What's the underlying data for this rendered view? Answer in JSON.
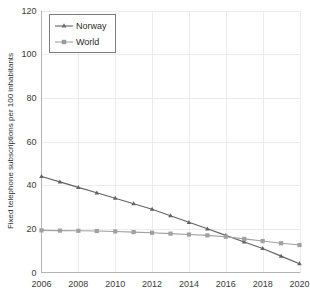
{
  "chart_data": {
    "type": "line",
    "title": "",
    "xlabel": "",
    "ylabel": "Fixed telephone subscriptions per 100 inhabitants",
    "x": [
      2006,
      2007,
      2008,
      2009,
      2010,
      2011,
      2012,
      2013,
      2014,
      2015,
      2016,
      2017,
      2018,
      2019,
      2020
    ],
    "xlim": [
      2006,
      2020
    ],
    "ylim": [
      0,
      120
    ],
    "xticks": [
      2006,
      2008,
      2010,
      2012,
      2014,
      2016,
      2018,
      2020
    ],
    "xtick_labels": [
      "2006",
      "2008",
      "2010",
      "2012",
      "2014",
      "2016",
      "2018",
      "2020"
    ],
    "yticks": [
      0,
      20,
      40,
      60,
      80,
      100,
      120
    ],
    "ytick_labels": [
      "0",
      "20",
      "40",
      "60",
      "80",
      "100",
      "120"
    ],
    "grid": true,
    "legend_position": "top-left",
    "series": [
      {
        "name": "Norway",
        "marker": "triangle",
        "color": "#636365",
        "values": [
          44.0,
          41.5,
          39.0,
          36.5,
          34.0,
          31.5,
          29.0,
          26.0,
          23.0,
          20.0,
          17.0,
          14.0,
          11.0,
          7.5,
          4.0
        ]
      },
      {
        "name": "World",
        "marker": "square",
        "color": "#a0a0a2",
        "values": [
          19.3,
          19.2,
          19.1,
          19.0,
          18.8,
          18.5,
          18.2,
          17.8,
          17.4,
          17.0,
          16.4,
          15.4,
          14.4,
          13.4,
          12.6
        ]
      }
    ]
  },
  "legend": {
    "entries": [
      {
        "label": "Norway"
      },
      {
        "label": "World"
      }
    ]
  },
  "colors": {
    "norway": "#636365",
    "world": "#a0a0a2",
    "grid": "#ececed",
    "axis": "#b4b4b6",
    "background": "#ffffff",
    "text": "#2e2e2e"
  }
}
